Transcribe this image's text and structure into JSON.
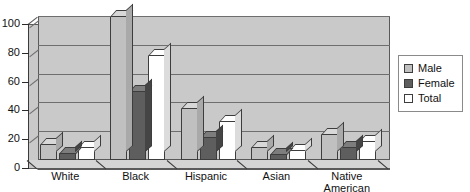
{
  "chart_data": {
    "type": "bar",
    "title": "",
    "subtitle": "",
    "xlabel": "",
    "ylabel": "",
    "ylim": [
      0,
      100
    ],
    "yticks": [
      0,
      20,
      40,
      60,
      80,
      100
    ],
    "grid": true,
    "legend_position": "right",
    "style": "3d-grouped-column",
    "categories": [
      "White",
      "Black",
      "Hispanic",
      "Asian",
      "Native American"
    ],
    "category_labels": [
      {
        "line1": "White",
        "line2": ""
      },
      {
        "line1": "Black",
        "line2": ""
      },
      {
        "line1": "Hispanic",
        "line2": ""
      },
      {
        "line1": "Asian",
        "line2": ""
      },
      {
        "line1": "Native",
        "line2": "American"
      }
    ],
    "series": [
      {
        "name": "Male",
        "color": "#c0c0c0",
        "values": [
          11,
          100,
          36,
          9,
          18
        ]
      },
      {
        "name": "Female",
        "color": "#5e5e5e",
        "values": [
          5,
          48,
          16,
          4,
          9
        ]
      },
      {
        "name": "Total",
        "color": "#ffffff",
        "values": [
          9,
          73,
          27,
          7,
          13
        ]
      }
    ]
  },
  "axis": {
    "y_tick_labels": [
      "100",
      "80",
      "60",
      "40",
      "20",
      "0"
    ]
  },
  "legend": {
    "items": [
      {
        "label": "Male",
        "swatch": "legend-swatch-male"
      },
      {
        "label": "Female",
        "swatch": "legend-swatch-female"
      },
      {
        "label": "Total",
        "swatch": "legend-swatch-total"
      }
    ]
  },
  "colors": {
    "plot_background": "#c9c9c9",
    "gridline": "#6e6e6e",
    "axis": "#3a3a3a",
    "male": "#c0c0c0",
    "female": "#5e5e5e",
    "total": "#ffffff"
  }
}
